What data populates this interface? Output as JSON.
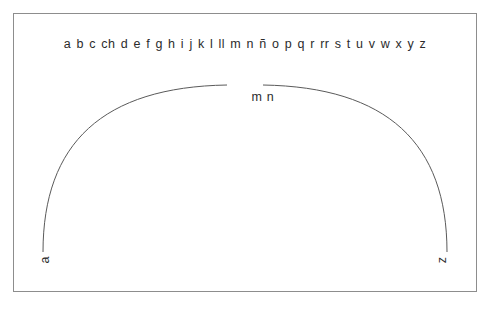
{
  "figure": {
    "name": "spanish-alphabet-sonority-arc",
    "background_color": "#ffffff",
    "frame_color": "#8d8d8d",
    "ink_color": "#2b2b2b",
    "curve_color": "#5a5a5a"
  },
  "alphabet": {
    "letters": [
      "a",
      "b",
      "c",
      "ch",
      "d",
      "e",
      "f",
      "g",
      "h",
      "i",
      "j",
      "k",
      "l",
      "ll",
      "m",
      "n",
      "ñ",
      "o",
      "p",
      "q",
      "r",
      "rr",
      "s",
      "t",
      "u",
      "v",
      "w",
      "x",
      "y",
      "z"
    ]
  },
  "arc": {
    "apex_label": "m n",
    "start_label": "a",
    "end_label": "z"
  },
  "chart_data": {
    "type": "line",
    "title": "",
    "xlabel": "",
    "ylabel": "",
    "categories": [
      "a",
      "b",
      "c",
      "ch",
      "d",
      "e",
      "f",
      "g",
      "h",
      "i",
      "j",
      "k",
      "l",
      "ll",
      "m",
      "n",
      "ñ",
      "o",
      "p",
      "q",
      "r",
      "rr",
      "s",
      "t",
      "u",
      "v",
      "w",
      "x",
      "y",
      "z"
    ],
    "annotations": [
      "a",
      "m n",
      "z"
    ],
    "grid": false,
    "legend": false
  }
}
